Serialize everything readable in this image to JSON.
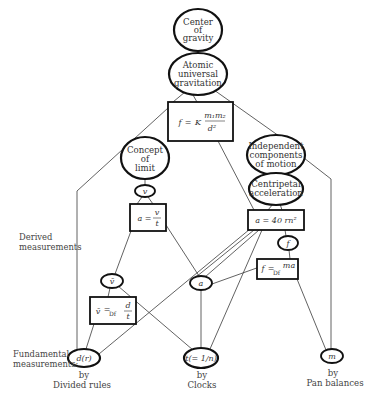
{
  "diagram": {
    "nodes": {
      "center_of_gravity": {
        "lines": [
          "Center",
          "of",
          "gravity"
        ]
      },
      "atomic_gravitation": {
        "lines": [
          "Atomic",
          "universal",
          "gravitation"
        ]
      },
      "gravitation_formula": {
        "lhs": "f",
        "eq": "=",
        "k": "K",
        "num": "m₁m₂",
        "den": "d²"
      },
      "concept_of_limit": {
        "lines": [
          "Concept",
          "of",
          "limit"
        ]
      },
      "velocity": {
        "label": "v"
      },
      "accel_formula": {
        "lhs": "a",
        "eq": "=",
        "num": "v",
        "den": "t"
      },
      "independent_components": {
        "lines": [
          "Independent",
          "components",
          "of motion"
        ]
      },
      "centripetal_acceleration": {
        "lines": [
          "Centripetal",
          "acceleration"
        ]
      },
      "centripetal_formula": {
        "text": "a  =  40 rn²"
      },
      "force": {
        "label": "f"
      },
      "force_formula": {
        "lhs": "f",
        "def": "=",
        "sub": "Df",
        "rhs": "ma"
      },
      "mean_velocity": {
        "label": "v̄"
      },
      "acceleration": {
        "label": "a"
      },
      "mean_velocity_formula": {
        "lhs": "v̄",
        "def": "=",
        "sub": "Df",
        "num": "d",
        "den": "t"
      },
      "distance": {
        "label": "d(r)"
      },
      "time": {
        "label": "t(= 1/n)"
      },
      "mass": {
        "label": "m"
      }
    },
    "side_labels": {
      "derived": [
        "Derived",
        "measurements"
      ],
      "fundamental": [
        "Fundamental",
        "measurements:"
      ]
    },
    "captions": {
      "rules": [
        "by",
        "Divided rules"
      ],
      "clocks": [
        "by",
        "Clocks"
      ],
      "balances": [
        "by",
        "Pan balances"
      ]
    }
  }
}
